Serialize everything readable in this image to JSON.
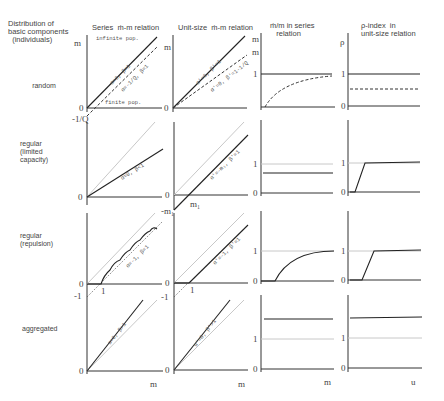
{
  "headers": {
    "col0": "Distribution of\nbasic components\n  (individuals)",
    "col1": "Series  ṁ-m relation",
    "col2": "Unit-size  ṁ-m relation",
    "col3": "ṁ/m in series\n   relation",
    "col4": "ρ-index  in\nunit-size relation"
  },
  "rows": [
    {
      "label": "random"
    },
    {
      "label": "regular\n(limited\ncapacity)"
    },
    {
      "label": "regular\n(repulsion)"
    },
    {
      "label": "aggregated"
    }
  ],
  "annotations": {
    "infinite_pop": "infinite pop.",
    "finite_pop": "finite pop.",
    "r1c1_solid": "α=0, β=1",
    "r1c1_dash": "α=-1/Q, β=1",
    "r1c2_solid": "α'=0, β'=1",
    "r1c2_dash": "α'=0, β'=1-1/Q",
    "r2c1": "α=0, β<1",
    "r2c2": "α'=-m₁, β'=1",
    "r3c1": "α=-1, β=1",
    "r3c2": "α'=-1, β'=1",
    "r4c1": "α=0, β>1",
    "r4c2": "α'=0, β'>1"
  },
  "ticks": {
    "zero": "0",
    "one": "1",
    "minus_one": "-1",
    "minus_inv_q": "-1/Q",
    "m1": "m₁",
    "minus_m1": "-m₁"
  },
  "axes": {
    "y_mstar": "ṁ",
    "y_ratio": "ṁ/m",
    "y_rho": "ρ",
    "x_m": "m",
    "x_u": "u"
  }
}
